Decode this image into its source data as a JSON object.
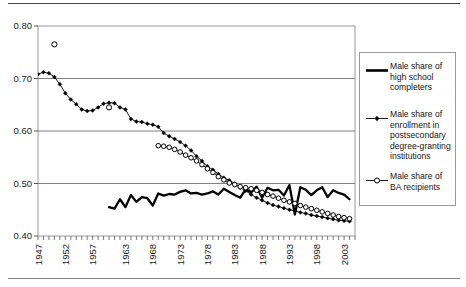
{
  "chart_data": {
    "type": "line",
    "title": "",
    "xlabel": "",
    "ylabel": "",
    "xlim": [
      1947,
      2005
    ],
    "ylim": [
      0.4,
      0.8
    ],
    "ytick_labels": [
      "0.80",
      "0.70",
      "0.60",
      "0.50",
      "0.40"
    ],
    "ytick_values": [
      0.8,
      0.7,
      0.6,
      0.5,
      0.4
    ],
    "xtick_labels": [
      "1947",
      "1952",
      "1957",
      "1963",
      "1968",
      "1973",
      "1978",
      "1983",
      "1988",
      "1993",
      "1998",
      "2003"
    ],
    "xtick_values": [
      1947,
      1952,
      1957,
      1963,
      1968,
      1973,
      1978,
      1983,
      1988,
      1993,
      1998,
      2003
    ],
    "grid": "horizontal",
    "legend_position": "right-outside",
    "series": [
      {
        "name": "Male share of high school completers",
        "marker": "none",
        "line": "thick-solid",
        "x": [
          1960,
          1961,
          1962,
          1963,
          1964,
          1965,
          1966,
          1967,
          1968,
          1969,
          1970,
          1971,
          1972,
          1973,
          1974,
          1975,
          1976,
          1977,
          1978,
          1979,
          1980,
          1981,
          1982,
          1983,
          1984,
          1985,
          1986,
          1987,
          1988,
          1989,
          1990,
          1991,
          1992,
          1993,
          1994,
          1995,
          1996,
          1997,
          1998,
          1999,
          2000,
          2001,
          2002,
          2003,
          2004
        ],
        "values": [
          0.455,
          0.452,
          0.47,
          0.455,
          0.478,
          0.465,
          0.474,
          0.472,
          0.458,
          0.481,
          0.477,
          0.48,
          0.479,
          0.484,
          0.487,
          0.481,
          0.482,
          0.479,
          0.481,
          0.485,
          0.479,
          0.49,
          0.484,
          0.478,
          0.473,
          0.489,
          0.483,
          0.494,
          0.473,
          0.492,
          0.487,
          0.488,
          0.477,
          0.497,
          0.441,
          0.493,
          0.488,
          0.478,
          0.487,
          0.493,
          0.474,
          0.487,
          0.482,
          0.479,
          0.47
        ]
      },
      {
        "name": "Male share of enrollment in postsecondary degree-granting institutions",
        "marker": "filled-diamond",
        "line": "thin-solid",
        "x": [
          1947,
          1948,
          1949,
          1950,
          1951,
          1952,
          1953,
          1954,
          1955,
          1956,
          1957,
          1958,
          1959,
          1960,
          1961,
          1962,
          1963,
          1964,
          1965,
          1966,
          1967,
          1968,
          1969,
          1970,
          1971,
          1972,
          1973,
          1974,
          1975,
          1976,
          1977,
          1978,
          1979,
          1980,
          1981,
          1982,
          1983,
          1984,
          1985,
          1986,
          1987,
          1988,
          1989,
          1990,
          1991,
          1992,
          1993,
          1994,
          1995,
          1996,
          1997,
          1998,
          1999,
          2000,
          2001,
          2002,
          2003,
          2004
        ],
        "values": [
          0.708,
          0.712,
          0.71,
          0.703,
          0.689,
          0.672,
          0.66,
          0.651,
          0.641,
          0.638,
          0.639,
          0.645,
          0.652,
          0.654,
          0.653,
          0.645,
          0.641,
          0.623,
          0.618,
          0.617,
          0.614,
          0.612,
          0.608,
          0.596,
          0.59,
          0.585,
          0.579,
          0.572,
          0.563,
          0.552,
          0.543,
          0.533,
          0.526,
          0.518,
          0.511,
          0.506,
          0.5,
          0.492,
          0.486,
          0.479,
          0.473,
          0.468,
          0.463,
          0.459,
          0.456,
          0.453,
          0.45,
          0.448,
          0.445,
          0.443,
          0.44,
          0.438,
          0.436,
          0.434,
          0.432,
          0.43,
          0.429,
          0.428
        ]
      },
      {
        "name": "Male share of BA recipients",
        "marker": "open-circle",
        "line": "thin-solid",
        "isolated_points": [
          {
            "x": 1950,
            "y": 0.765
          },
          {
            "x": 1960,
            "y": 0.645
          }
        ],
        "x": [
          1969,
          1970,
          1971,
          1972,
          1973,
          1974,
          1975,
          1976,
          1977,
          1978,
          1979,
          1980,
          1981,
          1982,
          1983,
          1984,
          1985,
          1986,
          1987,
          1988,
          1989,
          1990,
          1991,
          1992,
          1993,
          1994,
          1995,
          1996,
          1997,
          1998,
          1999,
          2000,
          2001,
          2002,
          2003,
          2004
        ],
        "values": [
          0.572,
          0.571,
          0.569,
          0.565,
          0.56,
          0.554,
          0.549,
          0.543,
          0.536,
          0.528,
          0.521,
          0.513,
          0.507,
          0.501,
          0.498,
          0.494,
          0.492,
          0.49,
          0.487,
          0.483,
          0.479,
          0.476,
          0.472,
          0.468,
          0.465,
          0.462,
          0.458,
          0.455,
          0.452,
          0.449,
          0.446,
          0.443,
          0.44,
          0.437,
          0.435,
          0.433
        ]
      }
    ]
  },
  "legend": {
    "entries": [
      {
        "label": "Male share of\nhigh school\ncompleters",
        "marker": "none",
        "name": "legend-high-school-completers"
      },
      {
        "label": "Male share of\nenrollment in\npostsecondary\ndegree-granting\ninstitutions",
        "marker": "filled-diamond",
        "name": "legend-enrollment"
      },
      {
        "label": "Male share of\nBA recipients",
        "marker": "open-circle",
        "name": "legend-ba-recipients"
      }
    ]
  },
  "colors": {
    "line": "#000000",
    "grid": "#808080",
    "axis": "#6e6e6e",
    "text": "#161616",
    "background": "#ffffff"
  }
}
